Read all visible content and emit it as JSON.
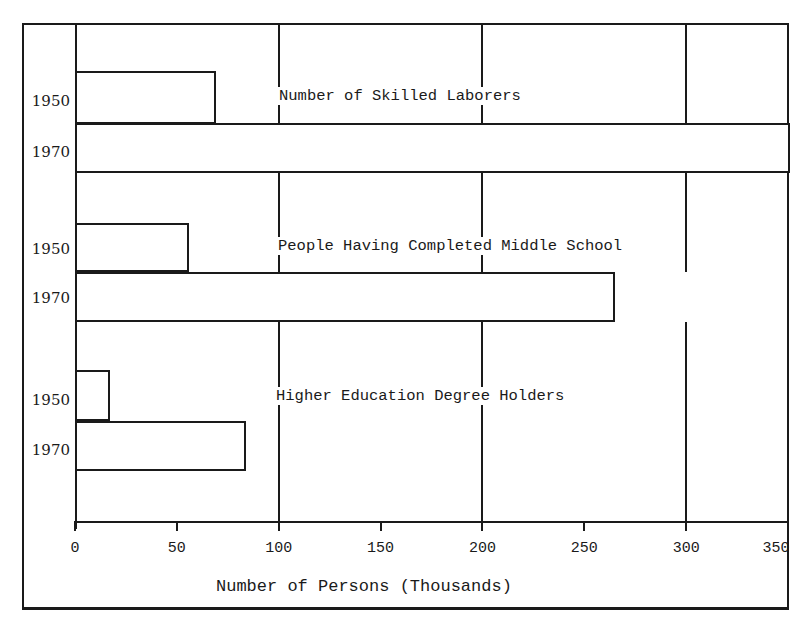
{
  "chart_data": {
    "type": "bar",
    "orientation": "horizontal",
    "title": "",
    "xlabel": "Number of Persons (Thousands)",
    "ylabel": "",
    "xlim": [
      0,
      350
    ],
    "xticks": [
      0,
      50,
      100,
      150,
      200,
      250,
      300,
      350
    ],
    "grid": true,
    "categories": [
      "Number of Skilled Laborers",
      "People Having Completed Middle School",
      "Higher Education Degree Holders"
    ],
    "series": [
      {
        "name": "1950",
        "values": [
          68,
          55,
          16
        ]
      },
      {
        "name": "1970",
        "values": [
          350,
          264,
          83
        ]
      }
    ],
    "annotations": [
      "1970 Number of Skilled Laborers bar extends beyond axis maximum (>350)"
    ]
  },
  "groups": [
    {
      "label": "Number of Skilled Laborers",
      "years": [
        "1950",
        "1970"
      ]
    },
    {
      "label": "People Having Completed Middle School",
      "years": [
        "1950",
        "1970"
      ]
    },
    {
      "label": "Higher Education Degree Holders",
      "years": [
        "1950",
        "1970"
      ]
    }
  ],
  "axis": {
    "ticks": [
      "0",
      "50",
      "100",
      "150",
      "200",
      "250",
      "300",
      "350"
    ],
    "label": "Number of Persons (Thousands)"
  }
}
